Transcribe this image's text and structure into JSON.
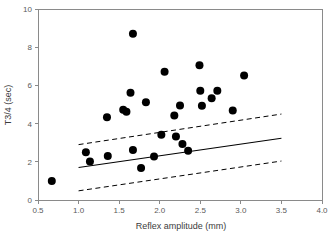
{
  "chart_data": {
    "type": "scatter",
    "title": "",
    "xlabel": "Reflex amplitude (mm)",
    "ylabel": "T3/4 (sec)",
    "xlim": [
      0.5,
      4.0
    ],
    "ylim": [
      0,
      10
    ],
    "xticks": [
      0.5,
      1.0,
      1.5,
      2.0,
      2.5,
      3.0,
      3.5,
      4.0
    ],
    "xtick_labels": [
      "0.5",
      "1.0",
      "1.5",
      "2.0",
      "2.5",
      "3.0",
      "3.5",
      "4.0"
    ],
    "yticks": [
      0,
      2,
      4,
      6,
      8,
      10
    ],
    "ytick_labels": [
      "0",
      "2",
      "4",
      "6",
      "8",
      "10"
    ],
    "grid": false,
    "legend": null,
    "marker": "filled-circle",
    "marker_color": "#000000",
    "marker_size_px": 5.2,
    "points": [
      {
        "x": 0.67,
        "y": 1.0
      },
      {
        "x": 1.09,
        "y": 2.5
      },
      {
        "x": 1.14,
        "y": 2.02
      },
      {
        "x": 1.35,
        "y": 4.33
      },
      {
        "x": 1.36,
        "y": 2.3
      },
      {
        "x": 1.55,
        "y": 4.72
      },
      {
        "x": 1.59,
        "y": 4.62
      },
      {
        "x": 1.64,
        "y": 5.62
      },
      {
        "x": 1.67,
        "y": 8.7
      },
      {
        "x": 1.67,
        "y": 2.62
      },
      {
        "x": 1.77,
        "y": 1.68
      },
      {
        "x": 1.83,
        "y": 5.12
      },
      {
        "x": 1.93,
        "y": 2.28
      },
      {
        "x": 2.02,
        "y": 3.42
      },
      {
        "x": 2.06,
        "y": 6.72
      },
      {
        "x": 2.18,
        "y": 4.43
      },
      {
        "x": 2.2,
        "y": 3.33
      },
      {
        "x": 2.25,
        "y": 4.95
      },
      {
        "x": 2.28,
        "y": 2.93
      },
      {
        "x": 2.35,
        "y": 2.58
      },
      {
        "x": 2.49,
        "y": 7.05
      },
      {
        "x": 2.5,
        "y": 5.72
      },
      {
        "x": 2.52,
        "y": 4.93
      },
      {
        "x": 2.64,
        "y": 5.33
      },
      {
        "x": 2.71,
        "y": 5.72
      },
      {
        "x": 2.9,
        "y": 4.68
      },
      {
        "x": 3.04,
        "y": 6.52
      }
    ],
    "fit_line": {
      "label": "regression line",
      "style": "solid",
      "x": [
        1.0,
        3.5
      ],
      "y": [
        1.7,
        3.23
      ]
    },
    "confidence_bands": [
      {
        "label": "upper confidence limit",
        "style": "dashed",
        "x": [
          1.0,
          3.5
        ],
        "y": [
          2.9,
          4.5
        ]
      },
      {
        "label": "lower confidence limit",
        "style": "dashed",
        "x": [
          1.0,
          3.5
        ],
        "y": [
          0.48,
          2.04
        ]
      }
    ]
  }
}
